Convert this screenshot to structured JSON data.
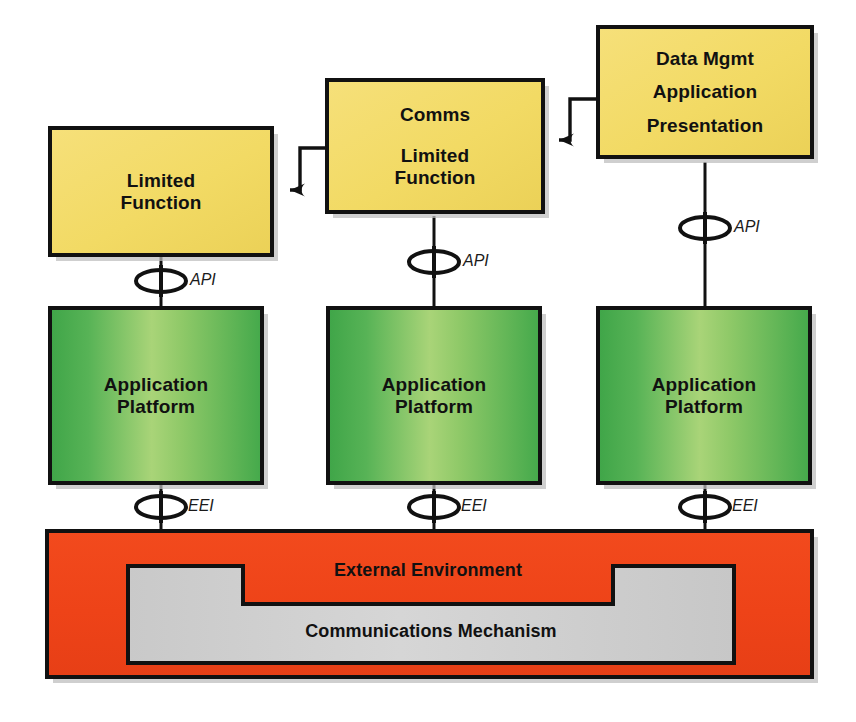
{
  "diagram": {
    "colors": {
      "yellow_fill": "#F3DC69",
      "green_dark": "#4AAE4E",
      "green_light": "#A3D06E",
      "red_fill": "#EF4419",
      "gray_fill": "#CFCFCF",
      "stroke": "#111111",
      "shadow": "#b9b9b9",
      "background": "#FFFFFF"
    },
    "application_boxes": [
      {
        "id": "limited-function-left",
        "lines": [
          "Limited",
          "Function"
        ],
        "fill": "yellow"
      },
      {
        "id": "comms-limited-function",
        "lines": [
          "Comms",
          "",
          "Limited",
          "Function"
        ],
        "fill": "yellow"
      },
      {
        "id": "data-mgmt-application-presentation",
        "lines": [
          "Data Mgmt",
          "Application",
          "Presentation"
        ],
        "fill": "yellow"
      }
    ],
    "platform_boxes": [
      {
        "id": "application-platform-left",
        "lines": [
          "Application",
          "Platform"
        ],
        "fill": "green"
      },
      {
        "id": "application-platform-center",
        "lines": [
          "Application",
          "Platform"
        ],
        "fill": "green"
      },
      {
        "id": "application-platform-right",
        "lines": [
          "Application",
          "Platform"
        ],
        "fill": "green"
      }
    ],
    "environment": {
      "id": "external-environment",
      "label": "External Environment",
      "fill": "red"
    },
    "communications": {
      "id": "communications-mechanism",
      "label": "Communications Mechanism",
      "fill": "gray"
    },
    "interfaces": {
      "api": [
        {
          "id": "api-left",
          "label": "API"
        },
        {
          "id": "api-center",
          "label": "API"
        },
        {
          "id": "api-right",
          "label": "API"
        }
      ],
      "eei": [
        {
          "id": "eei-left",
          "label": "EEI"
        },
        {
          "id": "eei-center",
          "label": "EEI"
        },
        {
          "id": "eei-right",
          "label": "EEI"
        }
      ]
    },
    "arrows": [
      {
        "id": "arrow-comms-to-limited-function",
        "from": "comms-limited-function",
        "to": "limited-function-left",
        "style": "stepped-left"
      },
      {
        "id": "arrow-datamgmt-to-comms",
        "from": "data-mgmt-application-presentation",
        "to": "comms-limited-function",
        "style": "stepped-left"
      }
    ]
  }
}
